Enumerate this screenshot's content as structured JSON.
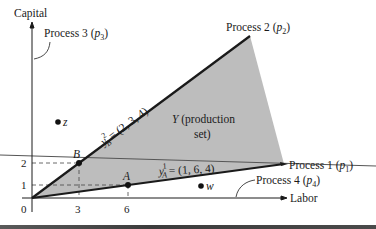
{
  "axes": {
    "y_label": "Capital",
    "x_label": "Labor",
    "origin_label": "0",
    "x_ticks": [
      "3",
      "6"
    ],
    "y_ticks": [
      "1",
      "2"
    ]
  },
  "processes": {
    "p1": {
      "name": "Process 1",
      "symbol": "p",
      "sub": "1"
    },
    "p2": {
      "name": "Process 2",
      "symbol": "p",
      "sub": "2"
    },
    "p3": {
      "name": "Process 3",
      "symbol": "p",
      "sub": "3"
    },
    "p4": {
      "name": "Process 4",
      "symbol": "p",
      "sub": "4"
    }
  },
  "points": {
    "A": {
      "label": "A",
      "x": 6,
      "y": 1
    },
    "B": {
      "label": "B",
      "x": 3,
      "y": 2
    },
    "z": {
      "label": "z"
    },
    "w": {
      "label": "w"
    }
  },
  "vectors": {
    "yB2": {
      "base": "y",
      "sup": "2",
      "sub": "B",
      "value": "= (2, 3, 4)"
    },
    "yA1": {
      "base": "y",
      "sup": "1",
      "sub": "A",
      "value": "= (1, 6, 4)"
    }
  },
  "region": {
    "name": "Y",
    "line1": "(production",
    "line2": "set)",
    "fill": "#bdbdbd"
  },
  "colors": {
    "ink": "#1a1a1a",
    "region_fill": "#bdbdbd",
    "thin_line": "#555555"
  }
}
